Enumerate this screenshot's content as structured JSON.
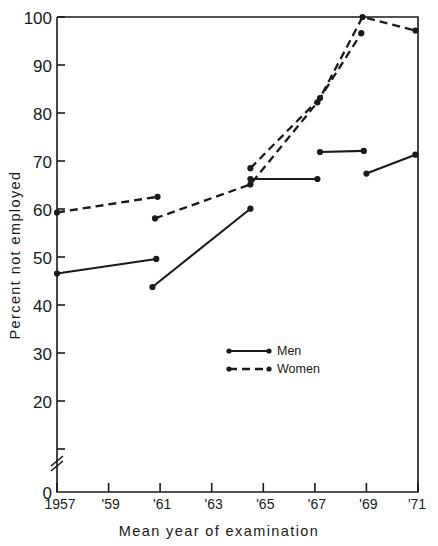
{
  "chart_data": {
    "type": "line",
    "title": "",
    "xlabel": "Mean year of examination",
    "ylabel": "Percent not employed",
    "xlim": [
      1957,
      1971
    ],
    "ylim": [
      0,
      100
    ],
    "y_axis_break": true,
    "y_break_note": "axis broken between 0 and 20",
    "grid": false,
    "legend_position": "center",
    "xticks": [
      1957,
      1959,
      1961,
      1963,
      1965,
      1967,
      1969,
      1971
    ],
    "xticklabels": [
      "1957",
      "'59",
      "'61",
      "'63",
      "'65",
      "'67",
      "'69",
      "'71"
    ],
    "yticks": [
      0,
      20,
      30,
      40,
      50,
      60,
      70,
      80,
      90,
      100
    ],
    "yticklabels": [
      "0",
      "20",
      "30",
      "40",
      "50",
      "60",
      "70",
      "80",
      "90",
      "100"
    ],
    "series": [
      {
        "name": "Men",
        "style": "solid",
        "segments": [
          {
            "x": [
              1957.0,
              1960.85
            ],
            "y": [
              52.5,
              55.2
            ]
          },
          {
            "x": [
              1960.7,
              1964.5
            ],
            "y": [
              50.0,
              64.5
            ]
          },
          {
            "x": [
              1964.5,
              1967.1
            ],
            "y": [
              70.0,
              70.0
            ]
          },
          {
            "x": [
              1967.2,
              1968.9
            ],
            "y": [
              75.0,
              75.2
            ]
          },
          {
            "x": [
              1969.0,
              1970.9
            ],
            "y": [
              71.0,
              74.5
            ]
          }
        ]
      },
      {
        "name": "Women",
        "style": "dashed",
        "segments": [
          {
            "x": [
              1957.0,
              1960.9
            ],
            "y": [
              63.8,
              66.7
            ]
          },
          {
            "x": [
              1960.8,
              1964.5,
              1967.1,
              1968.8
            ],
            "y": [
              62.7,
              69.0,
              84.2,
              97.0
            ]
          },
          {
            "x": [
              1964.5,
              1967.2,
              1968.85,
              1970.9
            ],
            "y": [
              72.0,
              85.0,
              100.0,
              97.5
            ]
          }
        ]
      }
    ]
  },
  "legend": {
    "items": [
      {
        "label": "Men",
        "style": "solid"
      },
      {
        "label": "Women",
        "style": "dashed"
      }
    ]
  }
}
